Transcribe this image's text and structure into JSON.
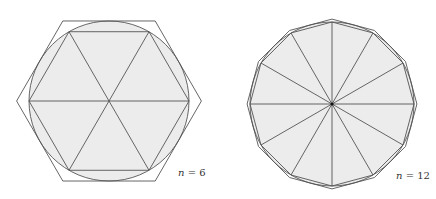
{
  "figure": {
    "panels": [
      {
        "id": "left",
        "label_var": "n",
        "label_eq": " = 6",
        "n": 6,
        "center": [
          109,
          101
        ],
        "inner_radius": 80,
        "circle_radius": 80,
        "outer_radius": 92.4,
        "label_pos": [
          178,
          176
        ]
      },
      {
        "id": "right",
        "label_var": "n",
        "label_eq": " = 12",
        "n": 12,
        "center": [
          332,
          104
        ],
        "inner_radius": 82,
        "circle_radius": 82,
        "outer_radius": 84.9,
        "label_pos": [
          396,
          179
        ]
      }
    ],
    "colors": {
      "fill": "#ececec",
      "stroke": "#555555",
      "center_dot": "#111111"
    }
  }
}
